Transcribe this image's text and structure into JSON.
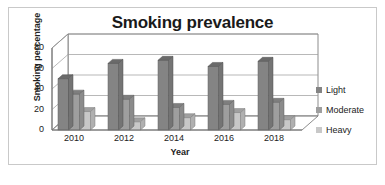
{
  "chart_data": {
    "type": "bar",
    "title": "Smoking prevalence",
    "xlabel": "Year",
    "ylabel": "Smoking percentage",
    "categories": [
      "2010",
      "2012",
      "2014",
      "2016",
      "2018"
    ],
    "series": [
      {
        "name": "Light",
        "values": [
          50,
          65,
          68,
          62,
          67
        ],
        "color": "#848484"
      },
      {
        "name": "Moderate",
        "values": [
          35,
          30,
          22,
          25,
          27
        ],
        "color": "#9e9e9e"
      },
      {
        "name": "Heavy",
        "values": [
          18,
          8,
          12,
          17,
          10
        ],
        "color": "#c8c8c8"
      }
    ],
    "ylim": [
      0,
      80
    ],
    "yticks": [
      0,
      20,
      40,
      60,
      80
    ],
    "ytick_labels": [
      "0",
      "20",
      "40",
      "60",
      "80"
    ],
    "grid": true,
    "legend_position": "right",
    "style": "3d-column"
  },
  "colors": {
    "border": "#c9c9c9",
    "gridline": "#9a9a9a",
    "axis": "#6e6e6e",
    "background": "#ffffff",
    "text": "#222222"
  }
}
